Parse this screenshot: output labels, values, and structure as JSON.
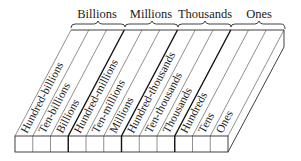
{
  "diagram": {
    "groups": [
      {
        "label": "Billions"
      },
      {
        "label": "Millions"
      },
      {
        "label": "Thousands"
      },
      {
        "label": "Ones"
      }
    ],
    "columns": [
      {
        "label": "Hundred-billions"
      },
      {
        "label": "Ten-billions"
      },
      {
        "label": "Billions"
      },
      {
        "label": "Hundred-millions"
      },
      {
        "label": "Ten-millions"
      },
      {
        "label": "Millions"
      },
      {
        "label": "Hundred-thousands"
      },
      {
        "label": "Ten-thousands"
      },
      {
        "label": "Thousands"
      },
      {
        "label": "Hundreds"
      },
      {
        "label": "Tens"
      },
      {
        "label": "Ones"
      }
    ],
    "colors": {
      "line": "#2a2a2a",
      "thin_line": "#555555",
      "background": "#ffffff"
    }
  }
}
